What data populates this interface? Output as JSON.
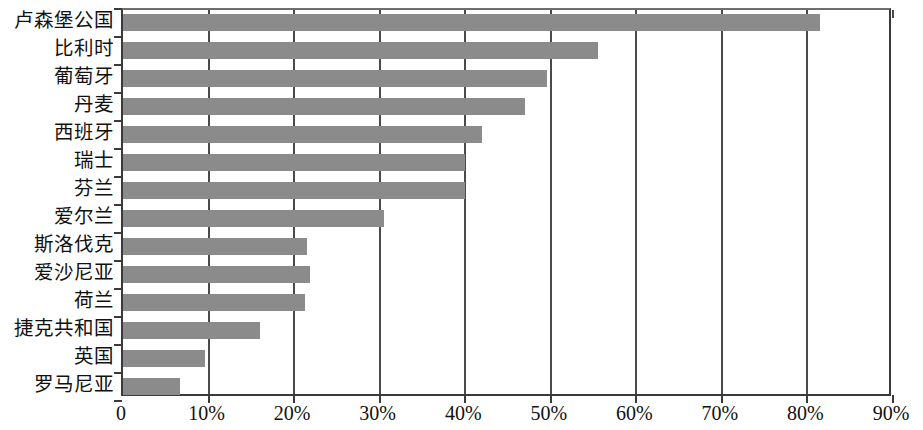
{
  "chart_data": {
    "type": "bar",
    "orientation": "horizontal",
    "title": "",
    "subtitle": "",
    "xlabel": "",
    "ylabel": "",
    "categories": [
      "卢森堡公国",
      "比利时",
      "葡萄牙",
      "丹麦",
      "西班牙",
      "瑞士",
      "芬兰",
      "爱尔兰",
      "斯洛伐克",
      "爱沙尼亚",
      "荷兰",
      "捷克共和国",
      "英国",
      "罗马尼亚"
    ],
    "values": [
      81.5,
      55.5,
      49.5,
      47.0,
      42.0,
      40.0,
      40.0,
      30.5,
      21.5,
      21.8,
      21.3,
      16.0,
      9.6,
      6.7
    ],
    "value_unit": "%",
    "xlim": [
      0,
      90
    ],
    "x_ticks": [
      0,
      10,
      20,
      30,
      40,
      50,
      60,
      70,
      80,
      90
    ],
    "x_tick_labels": [
      "0",
      "10%",
      "20%",
      "30%",
      "40%",
      "50%",
      "60%",
      "70%",
      "80%",
      "90%"
    ],
    "grid": true,
    "grid_axis": "x",
    "legend": false,
    "legend_position": "none",
    "bar_color": "#8b8b8b",
    "axis_color": "#3a3a3a",
    "background_color": "#ffffff"
  }
}
